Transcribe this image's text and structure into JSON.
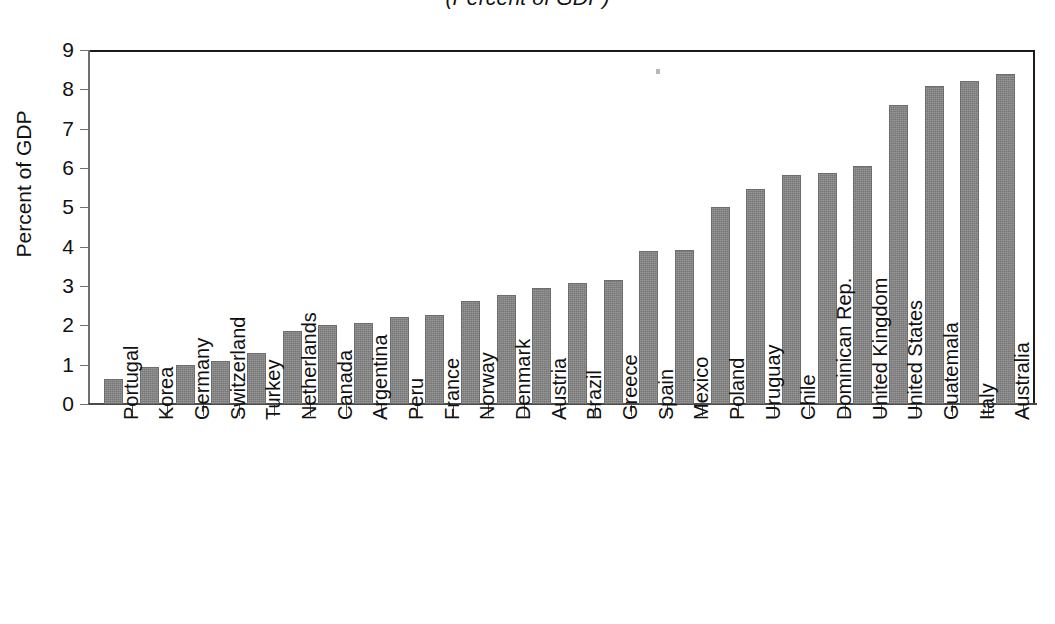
{
  "chart_data": {
    "type": "bar",
    "title": "(Percent of GDP)",
    "xlabel": "",
    "ylabel": "Percent of GDP",
    "ylim": [
      0,
      9
    ],
    "yticks": [
      0,
      1,
      2,
      3,
      4,
      5,
      6,
      7,
      8,
      9
    ],
    "ytick_labels": [
      "0",
      "1",
      "2",
      "3",
      "4",
      "5",
      "6",
      "7",
      "8",
      "9"
    ],
    "grid": false,
    "legend": null,
    "bar_color": "#808080",
    "categories": [
      "Portugal",
      "Korea",
      "Germany",
      "Switzerland",
      "Turkey",
      "Netherlands",
      "Canada",
      "Argentina",
      "Peru",
      "France",
      "Norway",
      "Denmark",
      "Austria",
      "Brazil",
      "Greece",
      "Spain",
      "Mexico",
      "Poland",
      "Uruguay",
      "Chile",
      "Dominican Rep.",
      "United Kingdom",
      "United States",
      "Guatemala",
      "Italy",
      "Australia"
    ],
    "values": [
      0.63,
      0.93,
      0.99,
      1.1,
      1.3,
      1.85,
      2.02,
      2.07,
      2.22,
      2.27,
      2.61,
      2.77,
      2.96,
      3.07,
      3.16,
      3.88,
      3.92,
      5.02,
      5.46,
      5.82,
      5.88,
      6.04,
      7.6,
      8.09,
      8.2,
      8.4
    ]
  },
  "axes": {
    "y_title": "Percent of GDP"
  }
}
